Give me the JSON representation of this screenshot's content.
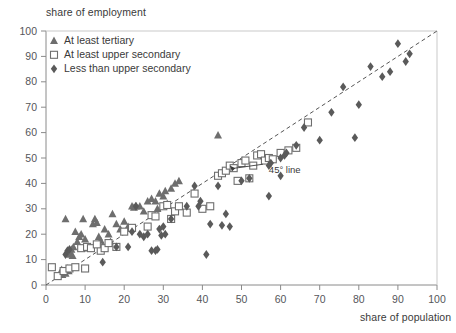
{
  "chart_data": {
    "type": "scatter",
    "title": "",
    "xlabel": "share of population",
    "ylabel": "share of employment",
    "xlim": [
      0,
      100
    ],
    "ylim": [
      0,
      100
    ],
    "xticks": [
      0,
      10,
      20,
      30,
      40,
      50,
      60,
      70,
      80,
      90,
      100
    ],
    "yticks": [
      0,
      10,
      20,
      30,
      40,
      50,
      60,
      70,
      80,
      90,
      100
    ],
    "grid": false,
    "legend_position": "top-left",
    "annotations": [
      {
        "text": "45° line",
        "x": 57,
        "y": 44,
        "points_to_x": 47,
        "points_to_y": 47
      }
    ],
    "reference_line": {
      "label": "45° line",
      "style": "dashed",
      "from": [
        0,
        0
      ],
      "to": [
        100,
        100
      ],
      "color": "#555555"
    },
    "series": [
      {
        "name": "At least tertiary",
        "marker": "triangle",
        "filled": true,
        "color": "#6e6e6e",
        "points": [
          [
            4,
            6
          ],
          [
            4.5,
            5
          ],
          [
            5,
            4.5
          ],
          [
            5.5,
            6.5
          ],
          [
            4.2,
            4
          ],
          [
            5.8,
            5.5
          ],
          [
            6,
            13
          ],
          [
            6.5,
            14
          ],
          [
            6.2,
            12
          ],
          [
            7,
            15
          ],
          [
            6.8,
            11.5
          ],
          [
            5,
            26
          ],
          [
            8,
            17
          ],
          [
            8.5,
            19
          ],
          [
            9,
            20
          ],
          [
            7.5,
            21
          ],
          [
            10,
            18
          ],
          [
            10.5,
            14.5
          ],
          [
            11,
            15
          ],
          [
            9.5,
            26
          ],
          [
            12,
            24
          ],
          [
            12.5,
            26
          ],
          [
            13,
            24.5
          ],
          [
            13.5,
            19
          ],
          [
            14,
            17.5
          ],
          [
            14.5,
            15.5
          ],
          [
            15,
            22
          ],
          [
            16,
            20
          ],
          [
            16.5,
            17
          ],
          [
            17,
            28
          ],
          [
            18,
            24
          ],
          [
            19,
            22
          ],
          [
            20,
            25
          ],
          [
            21,
            23
          ],
          [
            22,
            31
          ],
          [
            22.5,
            30.5
          ],
          [
            23,
            31
          ],
          [
            24,
            31
          ],
          [
            25,
            29
          ],
          [
            26,
            33
          ],
          [
            27,
            34
          ],
          [
            28,
            33
          ],
          [
            29,
            36
          ],
          [
            30,
            35
          ],
          [
            30.5,
            37
          ],
          [
            32,
            38
          ],
          [
            33,
            40
          ],
          [
            34,
            41
          ],
          [
            31,
            32
          ],
          [
            28.5,
            30
          ],
          [
            44,
            59
          ]
        ]
      },
      {
        "name": "At least upper secondary",
        "marker": "square",
        "filled": false,
        "color": "#6e6e6e",
        "points": [
          [
            1.5,
            7
          ],
          [
            3,
            3.5
          ],
          [
            4.5,
            5.5
          ],
          [
            6,
            6.5
          ],
          [
            7.5,
            7
          ],
          [
            10,
            6.5
          ],
          [
            9,
            14.5
          ],
          [
            10.5,
            15
          ],
          [
            11.5,
            14.5
          ],
          [
            14,
            13.5
          ],
          [
            15,
            14.5
          ],
          [
            18,
            15
          ],
          [
            13,
            16
          ],
          [
            16,
            16.5
          ],
          [
            20,
            21
          ],
          [
            22,
            22.5
          ],
          [
            26,
            23
          ],
          [
            27,
            27.5
          ],
          [
            28,
            27
          ],
          [
            30,
            31
          ],
          [
            31,
            31.5
          ],
          [
            32,
            26
          ],
          [
            33,
            29
          ],
          [
            34,
            31
          ],
          [
            36,
            28.5
          ],
          [
            38,
            36
          ],
          [
            40,
            30
          ],
          [
            42,
            31
          ],
          [
            44,
            43
          ],
          [
            45,
            44
          ],
          [
            46,
            45
          ],
          [
            47,
            47
          ],
          [
            48,
            46
          ],
          [
            50,
            48
          ],
          [
            51,
            49
          ],
          [
            53,
            47
          ],
          [
            54,
            51
          ],
          [
            55,
            51.5
          ],
          [
            56,
            49
          ],
          [
            57,
            50
          ],
          [
            58,
            49.5
          ],
          [
            60,
            52
          ],
          [
            62,
            53
          ],
          [
            64,
            54
          ],
          [
            49,
            41
          ],
          [
            52,
            42
          ],
          [
            67,
            64
          ]
        ]
      },
      {
        "name": "Less than upper secondary",
        "marker": "diamond",
        "filled": true,
        "color": "#5a5a5a",
        "points": [
          [
            5,
            12
          ],
          [
            5.5,
            13.5
          ],
          [
            6,
            14
          ],
          [
            14.5,
            9
          ],
          [
            18,
            15
          ],
          [
            21,
            15
          ],
          [
            22,
            21
          ],
          [
            23,
            31
          ],
          [
            24,
            20
          ],
          [
            25,
            19
          ],
          [
            26,
            20
          ],
          [
            27,
            13.5
          ],
          [
            28,
            13.5
          ],
          [
            28.5,
            14
          ],
          [
            29,
            22
          ],
          [
            30,
            23
          ],
          [
            30.5,
            20
          ],
          [
            29.5,
            19.5
          ],
          [
            32,
            26
          ],
          [
            36,
            31
          ],
          [
            38,
            39
          ],
          [
            39,
            31
          ],
          [
            39.5,
            33
          ],
          [
            41,
            12
          ],
          [
            42,
            24
          ],
          [
            44,
            39
          ],
          [
            45,
            23.5
          ],
          [
            46,
            28
          ],
          [
            50,
            41
          ],
          [
            52,
            42
          ],
          [
            47,
            23
          ],
          [
            57,
            47
          ],
          [
            57.5,
            48
          ],
          [
            60,
            50
          ],
          [
            61,
            51
          ],
          [
            61.5,
            52
          ],
          [
            57,
            35
          ],
          [
            60,
            43
          ],
          [
            64,
            55
          ],
          [
            66,
            62
          ],
          [
            70,
            57
          ],
          [
            73,
            68
          ],
          [
            76,
            78
          ],
          [
            79,
            58
          ],
          [
            80,
            71
          ],
          [
            83,
            86
          ],
          [
            86,
            82
          ],
          [
            88,
            84
          ],
          [
            90,
            95
          ],
          [
            92,
            88
          ],
          [
            93,
            91
          ]
        ]
      }
    ]
  },
  "legend": {
    "items": [
      {
        "label": "At least tertiary",
        "marker": "triangle"
      },
      {
        "label": "At least upper secondary",
        "marker": "square"
      },
      {
        "label": "Less than upper secondary",
        "marker": "diamond"
      }
    ]
  },
  "axes": {
    "y_title": "share of employment",
    "x_title": "share of population"
  }
}
